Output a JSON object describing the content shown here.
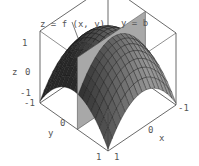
{
  "figure": {
    "surface_label": "z = f (x, y)",
    "plane_label": "y = b",
    "axes": {
      "x": {
        "label": "x",
        "ticks": [
          "-1",
          "0",
          "1"
        ]
      },
      "y": {
        "label": "y",
        "ticks": [
          "-1",
          "0",
          "1"
        ]
      },
      "z": {
        "label": "z",
        "ticks": [
          "-1",
          "0",
          "1"
        ]
      }
    },
    "colors": {
      "surface_dark": "#2a2a2a",
      "surface_light": "#8a8a8a",
      "plane": "#a8a8a8",
      "box": "#444444",
      "text": "#555555"
    }
  }
}
